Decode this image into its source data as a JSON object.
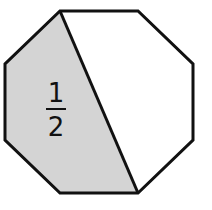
{
  "diagram": {
    "shape": "octagon",
    "shaded_label": {
      "numerator": "1",
      "denominator": "2"
    },
    "colors": {
      "outline": "#111111",
      "shaded_fill": "#d4d4d4",
      "unshaded_fill": "#ffffff",
      "background": "#ffffff"
    }
  }
}
